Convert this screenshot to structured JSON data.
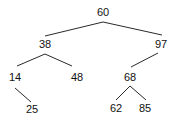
{
  "diagram": {
    "type": "binary-search-tree",
    "root": "60",
    "nodes": [
      {
        "id": "n60",
        "label": "60",
        "x": 103,
        "y": 13
      },
      {
        "id": "n38",
        "label": "38",
        "x": 45,
        "y": 45
      },
      {
        "id": "n97",
        "label": "97",
        "x": 161,
        "y": 45
      },
      {
        "id": "n14",
        "label": "14",
        "x": 15,
        "y": 78
      },
      {
        "id": "n48",
        "label": "48",
        "x": 77,
        "y": 78
      },
      {
        "id": "n68",
        "label": "68",
        "x": 130,
        "y": 78
      },
      {
        "id": "n25",
        "label": "25",
        "x": 32,
        "y": 110
      },
      {
        "id": "n62",
        "label": "62",
        "x": 116,
        "y": 109
      },
      {
        "id": "n85",
        "label": "85",
        "x": 145,
        "y": 109
      }
    ],
    "edges": [
      {
        "from": "60",
        "to": "38",
        "x1": 103,
        "y1": 22,
        "x2": 45,
        "y2": 36
      },
      {
        "from": "60",
        "to": "97",
        "x1": 103,
        "y1": 22,
        "x2": 162,
        "y2": 35
      },
      {
        "from": "38",
        "to": "14",
        "x1": 45,
        "y1": 54,
        "x2": 17,
        "y2": 66
      },
      {
        "from": "38",
        "to": "48",
        "x1": 45,
        "y1": 54,
        "x2": 72,
        "y2": 66
      },
      {
        "from": "97",
        "to": "68",
        "x1": 158,
        "y1": 53,
        "x2": 131,
        "y2": 67
      },
      {
        "from": "14",
        "to": "25",
        "x1": 15,
        "y1": 88,
        "x2": 31,
        "y2": 102
      },
      {
        "from": "68",
        "to": "62",
        "x1": 130,
        "y1": 86,
        "x2": 116,
        "y2": 100
      },
      {
        "from": "68",
        "to": "85",
        "x1": 130,
        "y1": 86,
        "x2": 146,
        "y2": 100
      }
    ]
  },
  "colors": {
    "background": "#ffffff",
    "edge": "#2a2a2a",
    "text": "#111111"
  }
}
